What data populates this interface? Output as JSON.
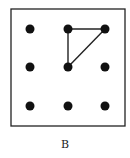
{
  "figure": {
    "caption": "B",
    "frame": {
      "x": 11,
      "y": 9,
      "width": 114,
      "height": 117,
      "stroke": "#222222"
    },
    "grid": {
      "rows": 3,
      "cols": 3,
      "xs": [
        30,
        68,
        105
      ],
      "ys": [
        29,
        67,
        106
      ],
      "dot_radius": 4.5,
      "dot_color": "#111111"
    },
    "lines": [
      {
        "from": [
          1,
          0
        ],
        "to": [
          2,
          0
        ]
      },
      {
        "from": [
          1,
          0
        ],
        "to": [
          1,
          1
        ]
      },
      {
        "from": [
          1,
          1
        ],
        "to": [
          2,
          0
        ]
      }
    ],
    "line_color": "#222222"
  }
}
